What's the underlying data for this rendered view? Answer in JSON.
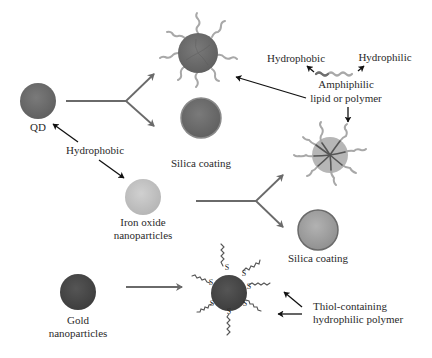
{
  "diagram": {
    "type": "nanoparticle-surface-functionalization-schematic",
    "colors": {
      "background": "#ffffff",
      "qd": "#6e6e6e",
      "silica_shell": "#9a9a9a",
      "iron_oxide": "#c2c2c2",
      "gold": "#4a4a4a",
      "ligand": "#a8a8a8",
      "arrow_gray": "#6a6a6a",
      "arrow_black": "#111111"
    },
    "labels": {
      "qd": "QD",
      "hydrophobic_core": "Hydrophobic",
      "silica_top": "Silica coating",
      "iron_oxide_line1": "Iron oxide",
      "iron_oxide_line2": "nanoparticles",
      "silica_bottom": "Silica coating",
      "gold_line1": "Gold",
      "gold_line2": "nanoparticles",
      "amph_hydrophobic": "Hydrophobic",
      "amph_hydrophilic": "Hydrophilic",
      "amph_line1": "Amphiphilic",
      "amph_line2": "lipid or polymer",
      "thiol_line1": "Thiol-containing",
      "thiol_line2": "hydrophilic polymer",
      "sulfur": "S"
    },
    "nodes": [
      {
        "id": "qd",
        "label": "QD"
      },
      {
        "id": "qd-amphiphilic-coated",
        "label": ""
      },
      {
        "id": "qd-silica-coated",
        "label": "Silica coating"
      },
      {
        "id": "iron-oxide",
        "label": "Iron oxide nanoparticles"
      },
      {
        "id": "iron-oxide-micelle",
        "label": ""
      },
      {
        "id": "iron-oxide-silica-coated",
        "label": "Silica coating"
      },
      {
        "id": "gold",
        "label": "Gold nanoparticles"
      },
      {
        "id": "gold-thiol-functionalized",
        "label": ""
      }
    ],
    "edges": [
      {
        "from": "qd",
        "to": "qd-amphiphilic-coated"
      },
      {
        "from": "qd",
        "to": "qd-silica-coated"
      },
      {
        "from": "iron-oxide",
        "to": "iron-oxide-micelle"
      },
      {
        "from": "iron-oxide",
        "to": "iron-oxide-silica-coated"
      },
      {
        "from": "gold",
        "to": "gold-thiol-functionalized"
      }
    ]
  }
}
